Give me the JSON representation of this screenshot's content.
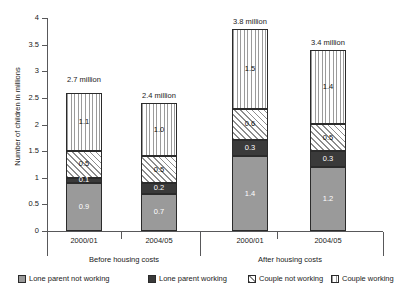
{
  "chart_data": {
    "type": "bar",
    "title": "",
    "subtitle": "",
    "xlabel": "",
    "ylabel": "Number of children in millions",
    "ylim": [
      0,
      4
    ],
    "ytick_labels": [
      "0",
      "0.5",
      "1",
      "1.5",
      "2",
      "2.5",
      "3",
      "3.5",
      "4"
    ],
    "ytick_values": [
      0,
      0.5,
      1,
      1.5,
      2,
      2.5,
      3,
      3.5,
      4
    ],
    "grid": false,
    "stacked": true,
    "legend_position": "bottom",
    "group_labels": [
      "Before housing costs",
      "After housing costs"
    ],
    "categories": [
      "2000/01",
      "2004/05",
      "2000/01",
      "2004/05"
    ],
    "series": [
      {
        "name": "Lone parent not working",
        "values": [
          0.9,
          0.7,
          1.4,
          1.2
        ],
        "value_labels": [
          "0.9",
          "0.7",
          "1.4",
          "1.2"
        ],
        "fill": "solid-grey",
        "color": "#9a9a9a"
      },
      {
        "name": "Lone parent working",
        "values": [
          0.1,
          0.2,
          0.3,
          0.3
        ],
        "value_labels": [
          "0.1",
          "0.2",
          "0.3",
          "0.3"
        ],
        "fill": "solid-dark",
        "color": "#3a3a3a"
      },
      {
        "name": "Couple not working",
        "values": [
          0.5,
          0.5,
          0.6,
          0.5
        ],
        "value_labels": [
          "0.5",
          "0.5",
          "0.6",
          "0.5"
        ],
        "fill": "diagonal-hatch",
        "color": "#8d8d8d"
      },
      {
        "name": "Couple working",
        "values": [
          1.1,
          1.0,
          1.5,
          1.4
        ],
        "value_labels": [
          "1.1",
          "1.0",
          "1.5",
          "1.4"
        ],
        "fill": "vertical-stripes",
        "color": "#9b9b9b"
      }
    ],
    "totals": [
      2.7,
      2.4,
      3.8,
      3.4
    ],
    "total_labels": [
      "2.7 million",
      "2.4 million",
      "3.8 million",
      "3.4 million"
    ]
  },
  "legend": {
    "items": [
      {
        "label": "Lone parent not working"
      },
      {
        "label": "Lone parent working"
      },
      {
        "label": "Couple not working"
      },
      {
        "label": "Couple working"
      }
    ]
  }
}
